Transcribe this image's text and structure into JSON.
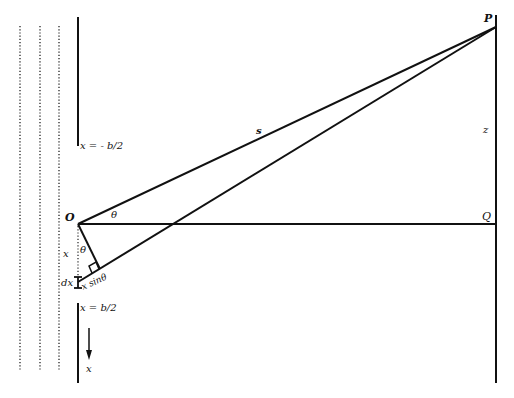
{
  "diagram": {
    "colors": {
      "line": "#111111",
      "background": "#ffffff"
    },
    "labels": {
      "P": "P",
      "Q": "Q",
      "O": "O",
      "s": "s",
      "z": "z",
      "theta_top": "θ",
      "theta_bottom": "θ",
      "x_distance": "x",
      "dx": "dx",
      "x_sin_theta": "x sinθ",
      "top_edge": "x = - b/2",
      "bottom_edge": "x = b/2",
      "x_axis": "x"
    },
    "elements": {
      "incoming_wavefronts": 3,
      "slit_edges": [
        "x = - b/2",
        "x = b/2"
      ],
      "screen": "right vertical line"
    }
  }
}
